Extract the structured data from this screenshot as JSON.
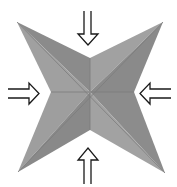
{
  "diagram": {
    "colors": {
      "background": "#ffffff",
      "facet_light": "#a0a0a0",
      "facet_dark": "#8a8a8a",
      "crease": "#7a7a7a",
      "arrow_stroke": "#1a1a1a",
      "arrow_fill": "#ffffff"
    },
    "star": {
      "center": [
        90,
        92
      ],
      "tips": {
        "top_left": [
          17,
          22
        ],
        "top_right": [
          163,
          22
        ],
        "bottom_left": [
          18,
          172
        ],
        "bottom_right": [
          165,
          173
        ]
      },
      "notches": {
        "top": [
          90,
          58
        ],
        "left": [
          51,
          92
        ],
        "right": [
          134,
          92
        ],
        "bottom": [
          90,
          130
        ]
      }
    },
    "arrows": [
      {
        "id": "top",
        "direction": "down"
      },
      {
        "id": "left",
        "direction": "right"
      },
      {
        "id": "right",
        "direction": "left"
      },
      {
        "id": "bottom",
        "direction": "up"
      }
    ]
  }
}
